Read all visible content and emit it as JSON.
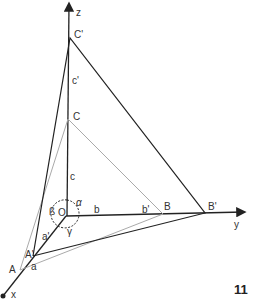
{
  "figure": {
    "number": "11",
    "axes": {
      "x": "x",
      "y": "y",
      "z": "z"
    },
    "origin": "O",
    "points": {
      "A": "A",
      "A_prime": "A'",
      "B": "B",
      "B_prime": "B'",
      "C": "C",
      "C_prime": "C'"
    },
    "segments": {
      "a": "a",
      "a_prime": "a'",
      "b": "b",
      "b_prime": "b'",
      "c": "c",
      "c_prime": "c'"
    },
    "angles": {
      "alpha": "α",
      "beta": "ß",
      "gamma": "γ"
    },
    "colors": {
      "primary_line": "#222222",
      "secondary_line": "#aaaaaa"
    }
  }
}
